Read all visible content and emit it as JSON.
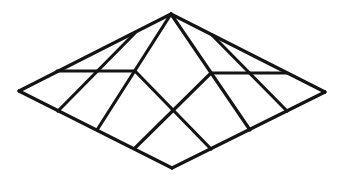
{
  "figure": {
    "stroke_color": "#141414",
    "background_color": "#ffffff",
    "stroke_width": 3.2
  },
  "vertices": {
    "apex": [
      171,
      14
    ],
    "left": [
      19,
      91
    ],
    "bottom": [
      172,
      168
    ],
    "right": [
      325,
      92
    ]
  },
  "segments": [
    {
      "name": "edge-apex-left",
      "from": [
        171,
        14
      ],
      "to": [
        19,
        91
      ]
    },
    {
      "name": "edge-left-bottom",
      "from": [
        19,
        91
      ],
      "to": [
        172,
        168
      ]
    },
    {
      "name": "edge-bottom-right",
      "from": [
        172,
        168
      ],
      "to": [
        325,
        92
      ]
    },
    {
      "name": "edge-right-apex",
      "from": [
        325,
        92
      ],
      "to": [
        171,
        14
      ]
    },
    {
      "name": "horizontal-left",
      "from": [
        57,
        71
      ],
      "to": [
        135,
        71
      ]
    },
    {
      "name": "horizontal-right",
      "from": [
        211,
        73
      ],
      "to": [
        287,
        73
      ]
    },
    {
      "name": "ridge-apex-left-inner",
      "from": [
        171,
        14
      ],
      "to": [
        97,
        130
      ]
    },
    {
      "name": "diagonal-upper-left",
      "from": [
        135,
        33
      ],
      "to": [
        58,
        111
      ]
    },
    {
      "name": "ridge-apex-right-inner",
      "from": [
        171,
        14
      ],
      "to": [
        250,
        130
      ]
    },
    {
      "name": "diagonal-upper-right",
      "from": [
        212,
        35
      ],
      "to": [
        287,
        111
      ]
    },
    {
      "name": "cross-left-to-bottom-right",
      "from": [
        135,
        71
      ],
      "to": [
        211,
        149
      ]
    },
    {
      "name": "cross-right-to-bottom-left",
      "from": [
        211,
        73
      ],
      "to": [
        135,
        148
      ]
    }
  ]
}
